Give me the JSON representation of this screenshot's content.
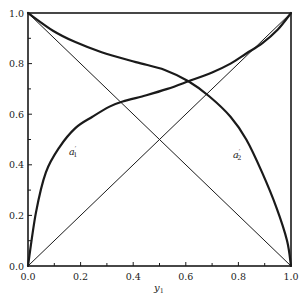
{
  "chart_data": {
    "type": "line",
    "title": "",
    "xlabel": "y1",
    "xlabel_main": "y",
    "xlabel_sub": "1",
    "ylabel": "",
    "xlim": [
      0,
      1
    ],
    "ylim": [
      0,
      1
    ],
    "grid": false,
    "legend": "none (curves labeled inline)",
    "x_ticks": [
      "0.0",
      "0.2",
      "0.4",
      "0.6",
      "0.8",
      "1.0"
    ],
    "y_ticks": [
      "0.0",
      "0.2",
      "0.4",
      "0.6",
      "0.8",
      "1.0"
    ],
    "series": [
      {
        "name": "a'1",
        "label_main": "a",
        "label_prime": "′",
        "label_sub": "1",
        "style": "thick",
        "x": [
          0.0,
          0.03,
          0.068,
          0.12,
          0.18,
          0.245,
          0.31,
          0.36,
          0.45,
          0.53,
          0.61,
          0.7,
          0.77,
          0.83,
          0.89,
          0.95,
          1.0
        ],
        "y": [
          0.0,
          0.21,
          0.37,
          0.47,
          0.545,
          0.59,
          0.63,
          0.65,
          0.675,
          0.7,
          0.73,
          0.765,
          0.8,
          0.84,
          0.88,
          0.935,
          1.0
        ]
      },
      {
        "name": "a'2",
        "label_main": "a",
        "label_prime": "′",
        "label_sub": "2",
        "style": "thick",
        "x": [
          0.0,
          0.095,
          0.18,
          0.28,
          0.41,
          0.52,
          0.61,
          0.69,
          0.77,
          0.83,
          0.89,
          0.945,
          0.985,
          1.0
        ],
        "y": [
          1.0,
          0.93,
          0.885,
          0.845,
          0.806,
          0.775,
          0.73,
          0.67,
          0.59,
          0.5,
          0.37,
          0.23,
          0.1,
          0.0
        ]
      },
      {
        "name": "diagonal y = x",
        "style": "thin",
        "x": [
          0.0,
          1.0
        ],
        "y": [
          0.0,
          1.0
        ]
      },
      {
        "name": "diagonal y = 1 - x",
        "style": "thin",
        "x": [
          0.0,
          1.0
        ],
        "y": [
          1.0,
          0.0
        ]
      }
    ],
    "annotations": [
      {
        "text": "a'1",
        "x": 0.16,
        "y": 0.44
      },
      {
        "text": "a'2",
        "x": 0.78,
        "y": 0.43
      }
    ]
  }
}
